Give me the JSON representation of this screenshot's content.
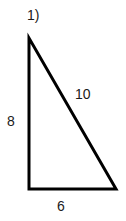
{
  "figure": {
    "problem_number": "1)",
    "shape": "right-triangle",
    "stroke_color": "#000000",
    "background_color": "#ffffff",
    "text_color": "#1a1a1a",
    "stroke_width": 3,
    "vertices": {
      "apex": {
        "x": 29,
        "y": 38
      },
      "bottom_left": {
        "x": 29,
        "y": 189
      },
      "bottom_right": {
        "x": 116,
        "y": 189
      }
    },
    "sides": [
      {
        "name": "vertical-leg",
        "label": "8",
        "from": "apex",
        "to": "bottom_left"
      },
      {
        "name": "hypotenuse",
        "label": "10",
        "from": "apex",
        "to": "bottom_right"
      },
      {
        "name": "horizontal-leg",
        "label": "6",
        "from": "bottom_left",
        "to": "bottom_right"
      }
    ]
  },
  "chart_data": {
    "type": "diagram",
    "title": "1)",
    "shape": "right triangle",
    "labels": [
      "8",
      "10",
      "6"
    ],
    "side_lengths": {
      "vertical_leg": 8,
      "hypotenuse": 10,
      "horizontal_leg": 6
    }
  }
}
